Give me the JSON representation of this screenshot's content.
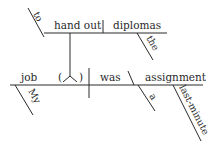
{
  "diagram": {
    "type": "sentence-diagram",
    "top_clause": {
      "infinitive_marker": "to",
      "verb": "hand out",
      "object": "diplomas",
      "object_modifier": "the"
    },
    "main_clause": {
      "subject": "job",
      "subject_modifier": "My",
      "appositive_placeholder": "( ⋏ )",
      "verb": "was",
      "complement": "assignment",
      "complement_modifiers": [
        "a",
        "last-minute"
      ]
    }
  }
}
